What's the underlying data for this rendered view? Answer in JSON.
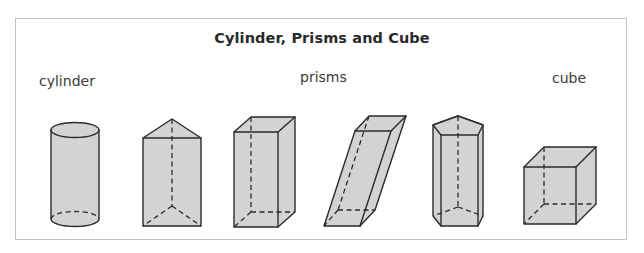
{
  "title": "Cylinder, Prisms and Cube",
  "labels": {
    "cylinder": "cylinder",
    "prisms": "prisms",
    "cube": "cube"
  },
  "shapes": [
    {
      "name": "cylinder",
      "group": "cylinder"
    },
    {
      "name": "triangular prism",
      "group": "prisms"
    },
    {
      "name": "rectangular prism",
      "group": "prisms"
    },
    {
      "name": "oblique rectangular prism",
      "group": "prisms"
    },
    {
      "name": "pentagonal prism",
      "group": "prisms"
    },
    {
      "name": "cube",
      "group": "cube"
    }
  ],
  "colors": {
    "fill": "#d3d3d3",
    "stroke": "#2b2b2b",
    "frame": "#c4c4c4"
  }
}
